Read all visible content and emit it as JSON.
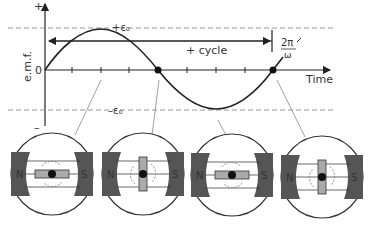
{
  "graph": {
    "y_axis_label": "e.m.f.",
    "y_plus": "+",
    "y_minus": "–",
    "zero": "0",
    "peak_pos": "+ε₀",
    "peak_neg": "–ε₀",
    "cycle_label": "+ cycle",
    "period_num": "2π",
    "period_den": "ω",
    "x_axis_label": "Time"
  },
  "generators": [
    {
      "north": "N",
      "south": "S",
      "coil": "horizontal"
    },
    {
      "north": "N",
      "south": "S",
      "coil": "vertical"
    },
    {
      "north": "N",
      "south": "S",
      "coil": "horizontal"
    },
    {
      "north": "N",
      "south": "S",
      "coil": "vertical"
    }
  ],
  "colors": {
    "line": "#222222",
    "magnet": "#555555",
    "coil": "#aaaaaa",
    "dashed": "#999999"
  }
}
